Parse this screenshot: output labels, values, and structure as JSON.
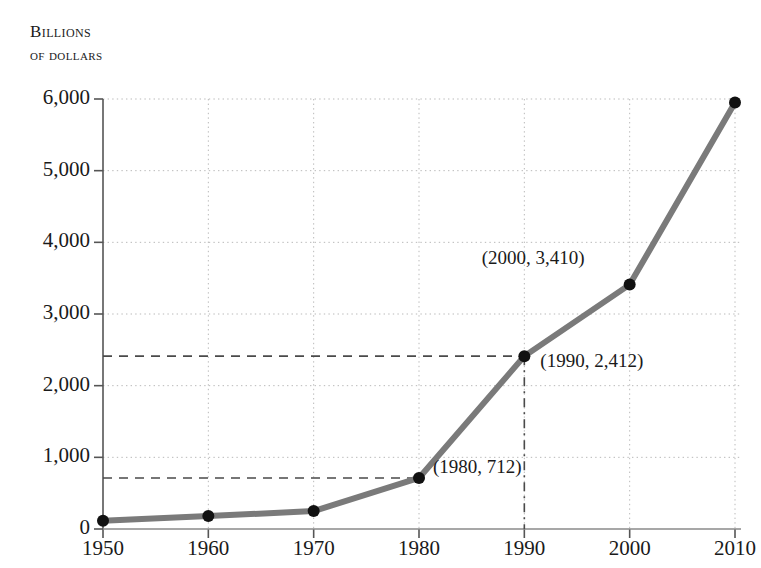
{
  "header": {
    "line1": "Billions",
    "line2": "of dollars"
  },
  "chart_data": {
    "type": "line",
    "title": "Billions of dollars",
    "xlabel": "",
    "ylabel": "Billions of dollars",
    "x": [
      1950,
      1960,
      1970,
      1980,
      1990,
      2000,
      2010
    ],
    "values": [
      115,
      180,
      250,
      712,
      2412,
      3410,
      5950
    ],
    "series": [
      {
        "name": "Billions of dollars",
        "values": [
          115,
          180,
          250,
          712,
          2412,
          3410,
          5950
        ]
      }
    ],
    "xtick_labels": [
      "1950",
      "1960",
      "1970",
      "1980",
      "1990",
      "2000",
      "2010"
    ],
    "ytick_labels": [
      "0",
      "1,000",
      "2,000",
      "3,000",
      "4,000",
      "5,000",
      "6,000"
    ],
    "ytick_values": [
      0,
      1000,
      2000,
      3000,
      4000,
      5000,
      6000
    ],
    "xlim": [
      1950,
      2010
    ],
    "ylim": [
      0,
      6000
    ],
    "grid": true,
    "legend": "none",
    "line_color": "#7a7a7a",
    "marker_color": "#111111",
    "annotations": [
      {
        "label": "(1980, 712)",
        "x": 1980,
        "y": 712
      },
      {
        "label": "(1990, 2,412)",
        "x": 1990,
        "y": 2412
      },
      {
        "label": "(2000, 3,410)",
        "x": 2000,
        "y": 3410
      }
    ],
    "reference_lines": [
      {
        "type": "horizontal",
        "value": 712,
        "style": "dashed"
      },
      {
        "type": "horizontal",
        "value": 2412,
        "style": "dashed"
      },
      {
        "type": "vertical",
        "value": 1990,
        "style": "dash-dot"
      }
    ]
  }
}
